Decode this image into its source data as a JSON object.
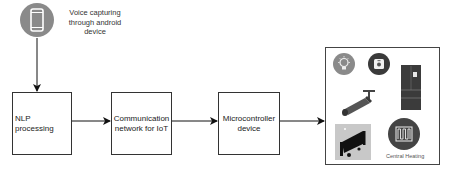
{
  "diagram": {
    "type": "flowchart",
    "direction": "left-to-right",
    "source": {
      "icon": "smartphone-icon",
      "label": "Voice capturing through android device",
      "label_lines": [
        "Voice capturing",
        "through android",
        "device"
      ],
      "icon_color": "#8a8a8a"
    },
    "nodes": [
      {
        "id": "nlp",
        "label": "NLP processing"
      },
      {
        "id": "comm",
        "label_lines": [
          "Communication",
          "network for IoT"
        ]
      },
      {
        "id": "mcu",
        "label_lines": [
          "Microcontroller",
          "device"
        ]
      }
    ],
    "appliances": {
      "items": [
        {
          "name": "smart-bulb",
          "icon": "lightbulb-icon"
        },
        {
          "name": "smart-plug",
          "icon": "socket-icon"
        },
        {
          "name": "refrigerator",
          "icon": "fridge-icon"
        },
        {
          "name": "security-camera",
          "icon": "cctv-camera-icon"
        },
        {
          "name": "air-conditioner",
          "icon": "air-conditioner-icon"
        },
        {
          "name": "central-heating",
          "icon": "heating-coil-icon",
          "label": "Central Heating"
        }
      ]
    },
    "edges": [
      {
        "from": "source",
        "to": "nlp"
      },
      {
        "from": "nlp",
        "to": "comm"
      },
      {
        "from": "comm",
        "to": "mcu"
      },
      {
        "from": "mcu",
        "to": "appliances"
      }
    ],
    "colors": {
      "line": "#111111",
      "box_border": "#333333",
      "icon_gray": "#8a8a8a",
      "icon_dark": "#3a3a3a"
    }
  }
}
